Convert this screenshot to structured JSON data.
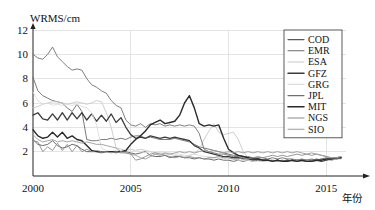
{
  "chart_data": {
    "type": "line",
    "title": "",
    "subtitle": "",
    "xlabel": "年份",
    "ylabel": "WRMS/cm",
    "xlim": [
      2000,
      2015.7
    ],
    "ylim": [
      0,
      12
    ],
    "grid": true,
    "legend_position": "top-right",
    "xticks": [
      "2000",
      "2005",
      "2010",
      "2015"
    ],
    "xtick_values": [
      2000,
      2005,
      2010,
      2015
    ],
    "yticks": [
      "2",
      "4",
      "6",
      "8",
      "10",
      "12"
    ],
    "ytick_values": [
      2,
      4,
      6,
      8,
      10,
      12
    ],
    "x_start": 2000,
    "x_step": 0.25,
    "series": [
      {
        "name": "COD",
        "color": "#5a5a5a",
        "width": 0.9,
        "values": [
          3.0,
          2.6,
          2.5,
          2.6,
          2.9,
          2.5,
          2.3,
          2.4,
          2.6,
          2.5,
          2.2,
          2.0,
          2.0,
          2.0,
          1.9,
          2.0,
          2.0,
          1.9,
          2.0,
          2.0,
          1.9,
          1.8,
          1.9,
          2.0,
          1.7,
          1.6,
          1.6,
          1.7,
          1.5,
          1.6,
          1.6,
          1.5,
          1.5,
          1.4,
          1.5,
          1.4,
          1.4,
          1.3,
          1.4,
          1.3,
          1.3,
          1.2,
          1.3,
          1.2,
          1.3,
          1.2,
          1.3,
          1.2,
          1.3,
          1.2,
          1.3,
          1.2,
          1.2,
          1.3,
          1.2,
          1.3,
          1.2,
          1.3,
          1.4,
          1.3,
          1.4,
          1.3,
          1.4,
          1.5
        ]
      },
      {
        "name": "EMR",
        "color": "#6b6b6b",
        "width": 0.9,
        "values": [
          8.1,
          7.0,
          6.6,
          6.4,
          6.2,
          6.1,
          6.0,
          5.6,
          5.3,
          5.9,
          5.3,
          3.0,
          2.9,
          2.9,
          3.0,
          3.0,
          3.1,
          3.0,
          3.1,
          3.0,
          3.2,
          3.3,
          3.3,
          3.1,
          3.2,
          3.1,
          3.0,
          3.0,
          3.0,
          3.1,
          3.0,
          2.9,
          2.8,
          2.6,
          2.4,
          2.3,
          2.2,
          2.1,
          2.0,
          1.9,
          1.8,
          1.7,
          1.7,
          1.6,
          1.6,
          1.5,
          1.5,
          1.5,
          1.4,
          1.5,
          1.4,
          1.5,
          1.4,
          1.4,
          1.3,
          1.4,
          1.3,
          1.4,
          1.3,
          1.4,
          1.5,
          1.4,
          1.5,
          1.5
        ]
      },
      {
        "name": "ESA",
        "color": "#c8c8c8",
        "width": 0.9,
        "values": [
          5.6,
          5.7,
          5.9,
          6.0,
          6.1,
          6.1,
          6.0,
          5.9,
          6.0,
          6.1,
          6.0,
          5.9,
          6.0,
          6.2,
          6.1,
          5.2,
          4.0,
          2.3,
          2.2,
          2.1,
          2.2,
          2.1,
          2.2,
          2.1,
          2.0,
          1.9,
          1.9,
          1.8,
          1.8,
          1.7,
          1.7,
          1.6,
          1.7,
          1.8,
          2.2,
          3.0,
          3.7,
          4.3,
          3.6,
          3.4,
          3.5,
          3.6,
          3.0,
          2.0,
          1.5,
          1.4,
          1.4,
          1.3,
          1.3,
          1.2,
          1.2,
          1.3,
          1.2,
          1.2,
          1.3,
          1.2,
          1.3,
          1.2,
          1.2,
          1.3,
          1.4,
          1.3,
          1.4,
          1.4
        ]
      },
      {
        "name": "GFZ",
        "color": "#3c3c3c",
        "width": 1.3,
        "values": [
          5.0,
          5.2,
          4.7,
          4.6,
          5.1,
          4.6,
          5.2,
          4.6,
          5.2,
          4.7,
          5.2,
          4.6,
          5.1,
          4.5,
          5.0,
          4.5,
          5.1,
          4.4,
          4.8,
          4.0,
          3.4,
          3.1,
          3.2,
          3.1,
          3.3,
          3.2,
          3.1,
          3.2,
          3.1,
          3.2,
          3.1,
          3.0,
          2.9,
          2.5,
          2.3,
          2.0,
          1.9,
          1.8,
          1.7,
          1.6,
          1.6,
          1.5,
          1.5,
          1.4,
          1.4,
          1.3,
          1.4,
          1.3,
          1.3,
          1.2,
          1.3,
          1.2,
          1.3,
          1.2,
          1.3,
          1.2,
          1.3,
          1.2,
          1.3,
          1.2,
          1.3,
          1.4,
          1.4,
          1.5
        ]
      },
      {
        "name": "GRG",
        "color": "#dcdcdc",
        "width": 0.9,
        "values": [
          6.9,
          6.2,
          5.9,
          6.0,
          5.8,
          5.9,
          5.8,
          5.9,
          5.8,
          5.9,
          5.7,
          5.6,
          5.2,
          4.2,
          2.3,
          2.1,
          2.0,
          2.1,
          2.0,
          2.1,
          2.0,
          2.1,
          2.0,
          1.9,
          2.0,
          1.9,
          2.0,
          1.9,
          1.9,
          1.8,
          1.8,
          1.7,
          1.7,
          1.8,
          1.7,
          1.6,
          1.6,
          1.5,
          1.5,
          1.4,
          1.4,
          1.4,
          1.3,
          1.3,
          1.3,
          1.2,
          1.2,
          1.2,
          1.2,
          1.2,
          1.2,
          1.2,
          1.2,
          1.2,
          1.3,
          1.2,
          1.3,
          1.2,
          1.3,
          1.3,
          1.4,
          1.4,
          1.4,
          1.5
        ]
      },
      {
        "name": "JPL",
        "color": "#707070",
        "width": 0.9,
        "values": [
          10.0,
          9.7,
          9.6,
          10.0,
          10.6,
          9.8,
          9.4,
          9.0,
          8.7,
          8.8,
          8.7,
          8.0,
          7.5,
          7.3,
          7.0,
          6.8,
          6.2,
          5.8,
          5.6,
          4.6,
          4.2,
          4.1,
          4.3,
          4.0,
          4.3,
          4.2,
          4.3,
          4.1,
          4.2,
          4.1,
          4.2,
          4.1,
          4.2,
          4.1,
          3.5,
          2.2,
          2.0,
          1.9,
          1.8,
          1.8,
          1.7,
          1.6,
          1.6,
          1.5,
          1.5,
          1.4,
          1.4,
          1.3,
          1.3,
          1.3,
          1.2,
          1.3,
          1.2,
          1.3,
          1.2,
          1.3,
          1.2,
          1.3,
          1.3,
          1.4,
          1.3,
          1.4,
          1.5,
          1.5
        ]
      },
      {
        "name": "MIT",
        "color": "#2b2b2b",
        "width": 1.4,
        "values": [
          3.8,
          3.3,
          3.1,
          3.2,
          3.6,
          3.2,
          3.6,
          3.1,
          3.3,
          3.0,
          2.9,
          2.5,
          2.1,
          2.0,
          2.0,
          2.0,
          2.0,
          2.0,
          2.0,
          2.1,
          2.6,
          3.0,
          3.3,
          3.7,
          4.2,
          4.4,
          4.6,
          4.3,
          4.4,
          4.5,
          5.0,
          6.0,
          6.6,
          5.6,
          4.3,
          4.1,
          4.2,
          4.1,
          4.2,
          3.1,
          2.2,
          1.9,
          1.7,
          1.6,
          1.5,
          1.4,
          1.4,
          1.3,
          1.3,
          1.2,
          1.3,
          1.2,
          1.2,
          1.3,
          1.2,
          1.3,
          1.2,
          1.2,
          1.3,
          1.3,
          1.4,
          1.4,
          1.5,
          1.5
        ]
      },
      {
        "name": "NGS",
        "color": "#8a8a8a",
        "width": 0.9,
        "values": [
          2.9,
          2.8,
          2.0,
          2.4,
          2.1,
          2.7,
          2.1,
          2.6,
          2.0,
          2.5,
          2.0,
          2.2,
          2.0,
          2.1,
          2.0,
          2.0,
          1.9,
          2.0,
          1.9,
          1.9,
          1.8,
          1.3,
          1.4,
          1.6,
          1.8,
          1.9,
          1.8,
          1.7,
          1.6,
          1.5,
          1.6,
          1.5,
          1.6,
          1.5,
          1.5,
          1.4,
          1.5,
          1.5,
          1.6,
          1.5,
          1.5,
          1.4,
          1.4,
          1.5,
          1.4,
          1.5,
          1.6,
          1.5,
          1.6,
          1.7,
          1.6,
          1.7,
          1.6,
          1.7,
          1.8,
          1.7,
          1.8,
          1.7,
          1.8,
          1.7,
          1.6,
          1.5,
          1.5,
          1.6
        ]
      },
      {
        "name": "SIO",
        "color": "#9a9a9a",
        "width": 0.9,
        "values": [
          3.4,
          3.0,
          2.8,
          2.9,
          3.0,
          2.8,
          2.9,
          2.8,
          2.9,
          2.8,
          2.7,
          2.8,
          2.7,
          2.6,
          2.6,
          2.5,
          2.4,
          2.3,
          2.0,
          1.9,
          1.8,
          1.7,
          1.5,
          1.4,
          1.6,
          1.8,
          1.7,
          1.9,
          1.8,
          1.9,
          2.0,
          1.9,
          2.0,
          1.9,
          2.0,
          2.1,
          2.0,
          2.1,
          2.0,
          1.9,
          2.0,
          1.9,
          2.0,
          1.9,
          2.0,
          1.9,
          2.0,
          1.9,
          2.0,
          1.9,
          2.0,
          1.9,
          2.0,
          1.9,
          2.0,
          1.9,
          1.8,
          1.9,
          1.8,
          1.7,
          1.6,
          1.5,
          1.5,
          1.6
        ]
      }
    ]
  }
}
